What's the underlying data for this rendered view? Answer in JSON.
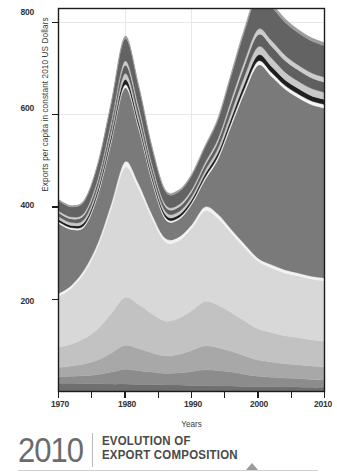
{
  "axes": {
    "ylabel": "Exports per capita in constant 2010 US Dollars",
    "xlabel": "Years",
    "yticks": [
      "200",
      "400",
      "600",
      "800"
    ],
    "xticks": [
      "1970",
      "1980",
      "1990",
      "2000",
      "2010"
    ]
  },
  "footer": {
    "year": "2010",
    "title_line1": "EVOLUTION OF",
    "title_line2": "EXPORT COMPOSITION",
    "marker": "triangle-up-icon"
  },
  "colors": {
    "frame": "#1c1c1c",
    "grid": "#e6e6e6",
    "background": "#ffffff",
    "tick_text": "#333333",
    "title_year": "#6b6b6b",
    "title_text": "#4a4a4a",
    "marker": "#9a9a9a"
  },
  "chart_data": {
    "type": "area",
    "stacked": true,
    "title": "EVOLUTION OF EXPORT COMPOSITION",
    "xlabel": "Years",
    "ylabel": "Exports per capita in constant 2010 US Dollars",
    "xlim": [
      1970,
      2010
    ],
    "ylim": [
      0,
      830
    ],
    "yticks": [
      200,
      400,
      600,
      800
    ],
    "xticks": [
      1970,
      1980,
      1990,
      2000,
      2010
    ],
    "grid": true,
    "legend": "none",
    "x": [
      1970,
      1972,
      1974,
      1976,
      1978,
      1980,
      1982,
      1984,
      1986,
      1988,
      1990,
      1992,
      1994,
      1996,
      1998,
      2000,
      2002,
      2004,
      2006,
      2008,
      2010
    ],
    "series": [
      {
        "name": "layer-1-base-dark",
        "color": "#6f6f6f",
        "values": [
          18,
          18,
          17,
          17,
          16,
          16,
          15,
          15,
          14,
          14,
          13,
          13,
          12,
          12,
          11,
          11,
          11,
          10,
          10,
          9,
          9
        ]
      },
      {
        "name": "layer-2-mid-gray",
        "color": "#8c8c8c",
        "values": [
          14,
          15,
          17,
          20,
          26,
          32,
          30,
          27,
          25,
          26,
          30,
          34,
          33,
          30,
          26,
          22,
          20,
          19,
          18,
          17,
          16
        ]
      },
      {
        "name": "layer-3-light-gray",
        "color": "#a8a8a8",
        "values": [
          20,
          22,
          26,
          32,
          42,
          52,
          48,
          42,
          38,
          40,
          46,
          52,
          50,
          45,
          40,
          35,
          33,
          31,
          30,
          29,
          28
        ]
      },
      {
        "name": "layer-4-pale-gray",
        "color": "#c2c2c2",
        "values": [
          44,
          48,
          56,
          68,
          86,
          104,
          96,
          85,
          76,
          78,
          86,
          96,
          92,
          84,
          76,
          68,
          64,
          61,
          59,
          57,
          56
        ]
      },
      {
        "name": "layer-5-very-pale",
        "color": "#d8d8d8",
        "values": [
          110,
          122,
          144,
          180,
          230,
          282,
          252,
          208,
          172,
          168,
          178,
          196,
          188,
          172,
          158,
          146,
          140,
          136,
          134,
          132,
          131
        ]
      },
      {
        "name": "layer-6-white-band",
        "color": "#f2f2f2",
        "values": [
          6,
          6,
          7,
          8,
          10,
          12,
          11,
          9,
          8,
          8,
          8,
          9,
          9,
          8,
          8,
          7,
          7,
          7,
          6,
          6,
          6
        ]
      },
      {
        "name": "layer-7-dominant-gray",
        "color": "#7a7a7a",
        "values": [
          152,
          120,
          92,
          104,
          134,
          160,
          120,
          72,
          42,
          38,
          44,
          58,
          120,
          226,
          330,
          418,
          408,
          392,
          380,
          372,
          368
        ]
      },
      {
        "name": "layer-8-thin-white",
        "color": "#f5f5f5",
        "values": [
          4,
          4,
          4,
          5,
          6,
          7,
          6,
          5,
          4,
          4,
          4,
          5,
          6,
          7,
          8,
          9,
          9,
          8,
          8,
          8,
          8
        ]
      },
      {
        "name": "layer-9-black-line",
        "color": "#1f1f1f",
        "values": [
          5,
          5,
          6,
          7,
          9,
          11,
          9,
          7,
          6,
          6,
          6,
          7,
          8,
          10,
          12,
          13,
          13,
          12,
          12,
          11,
          11
        ]
      },
      {
        "name": "layer-10-light-band",
        "color": "#c9c9c9",
        "values": [
          6,
          6,
          7,
          8,
          10,
          13,
          11,
          9,
          7,
          7,
          7,
          8,
          10,
          13,
          16,
          18,
          18,
          17,
          16,
          16,
          15
        ]
      },
      {
        "name": "layer-11-dark-band",
        "color": "#5f5f5f",
        "values": [
          8,
          8,
          9,
          11,
          14,
          18,
          15,
          12,
          10,
          10,
          10,
          11,
          14,
          18,
          22,
          26,
          26,
          25,
          24,
          23,
          22
        ]
      },
      {
        "name": "layer-12-pale-thin",
        "color": "#cdcdcd",
        "values": [
          4,
          4,
          5,
          6,
          7,
          9,
          8,
          6,
          5,
          5,
          5,
          6,
          7,
          9,
          11,
          12,
          12,
          12,
          11,
          11,
          11
        ]
      },
      {
        "name": "layer-13-top-dark",
        "color": "#636363",
        "values": [
          22,
          22,
          25,
          30,
          38,
          48,
          42,
          34,
          28,
          28,
          30,
          33,
          40,
          52,
          64,
          74,
          73,
          71,
          70,
          69,
          68
        ]
      },
      {
        "name": "layer-14-cap",
        "color": "#9d9d9d",
        "values": [
          3,
          3,
          3,
          4,
          5,
          6,
          5,
          4,
          4,
          4,
          4,
          4,
          5,
          6,
          7,
          8,
          8,
          8,
          7,
          7,
          7
        ]
      }
    ],
    "totals": [
      416,
      403,
      418,
      500,
      633,
      770,
      668,
      543,
      439,
      436,
      471,
      532,
      594,
      712,
      808,
      867,
      842,
      811,
      789,
      767,
      756
    ]
  }
}
